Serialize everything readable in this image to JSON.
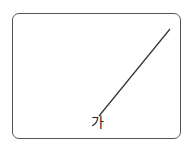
{
  "diagram": {
    "line": {
      "x1": 170,
      "y1": 29,
      "x2": 99,
      "y2": 116,
      "color": "#333333"
    },
    "label": "가"
  }
}
